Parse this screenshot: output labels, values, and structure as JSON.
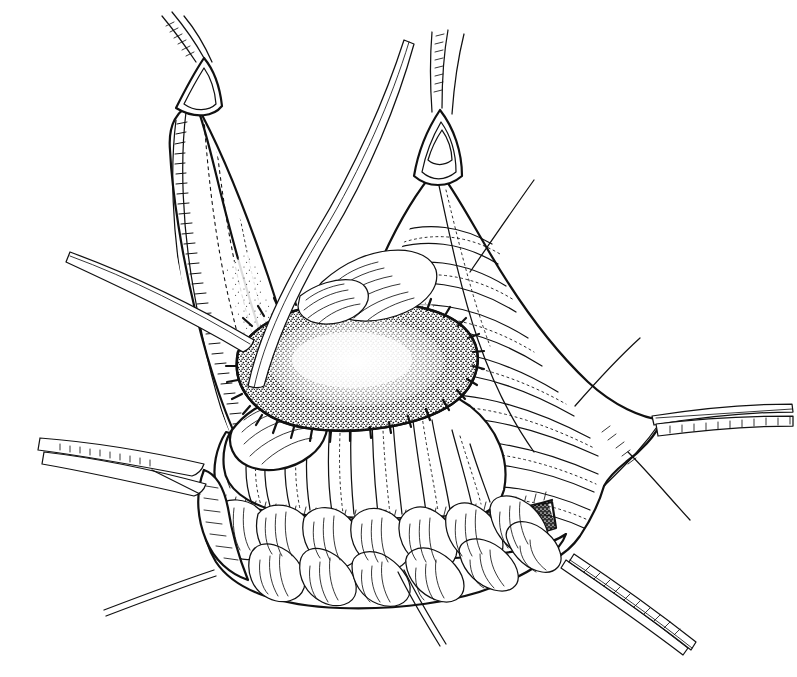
{
  "figure": {
    "domain": "medical-surgical-line-art",
    "title": "",
    "caption": "",
    "technique": "pen-and-ink stipple and hatch line drawing",
    "background_color": "#ffffff",
    "ink_color": "#111111",
    "width": 797,
    "height": 677,
    "has_text_labels": false,
    "label_count": 0
  },
  "scene": {
    "subject": "abdominal wall / hernia repair with sutured graft patch",
    "view": "intraoperative close-up, oblique",
    "regions": [
      {
        "name": "left-tissue-flap",
        "description": "tall conical flap of fascia retracted upward at left, hatched cut edge on its left margin",
        "apex": [
          200,
          95
        ],
        "clamped": true
      },
      {
        "name": "right-tissue-flap",
        "description": "large broad flap retracted upward and to the right, wrinkled transverse folds",
        "apex": [
          432,
          150
        ],
        "clamped": true
      },
      {
        "name": "graft-patch",
        "description": "oval stippled graft/mesh inlay sutured around its whole perimeter",
        "center": [
          358,
          365
        ],
        "approx_width": 230,
        "approx_height": 110
      },
      {
        "name": "bowel-loops",
        "description": "coils of small bowel visible in the depth beneath the lower tissue edge",
        "center": [
          330,
          540
        ]
      },
      {
        "name": "dark-shadow-band",
        "description": "solid dark stippled shadow band under the everted lower tissue edge",
        "center": [
          330,
          512
        ]
      }
    ]
  },
  "instruments": [
    {
      "id": "clamp-left-apex",
      "type": "triangular-jaw tissue clamp",
      "name": "left apex clamp",
      "grip_point": [
        196,
        100
      ],
      "shaft_angle_deg": 62,
      "has_ratchet_serrations": true
    },
    {
      "id": "clamp-right-apex",
      "type": "triangular-jaw tissue clamp",
      "name": "right apex clamp",
      "grip_point": [
        437,
        160
      ],
      "shaft_angle_deg": 78,
      "has_ratchet_serrations": true
    },
    {
      "id": "retractor-long-curved",
      "type": "long curved retractor / probe",
      "name": "curved retractor crossing midline",
      "tip": [
        250,
        390
      ],
      "handle": [
        410,
        40
      ]
    },
    {
      "id": "forceps-upper-left",
      "type": "straight forceps",
      "name": "upper left forceps",
      "tip": [
        250,
        345
      ],
      "handle": [
        70,
        252
      ]
    },
    {
      "id": "forceps-lower-left",
      "type": "hemostat forceps",
      "name": "lower left hemostat",
      "tip": [
        200,
        462
      ],
      "handle": [
        40,
        440
      ],
      "has_ratchet_serrations": true
    },
    {
      "id": "hemostat-right",
      "type": "hemostat",
      "name": "right edge hemostat",
      "tip": [
        655,
        418
      ],
      "handle": [
        790,
        430
      ],
      "has_ratchet_serrations": true
    },
    {
      "id": "hemostat-lower-right",
      "type": "hemostat",
      "name": "lower right hemostat",
      "tip": [
        568,
        566
      ],
      "handle": [
        690,
        640
      ],
      "has_ratchet_serrations": true
    }
  ],
  "sutures": [
    {
      "id": "graft-perimeter-suture",
      "name": "interrupted perimeter sutures around graft",
      "style": "interrupted",
      "stitch_count": 34,
      "closed_loop": true
    },
    {
      "id": "free-thread-upper-right",
      "name": "free suture thread upper right",
      "from": [
        470,
        270
      ],
      "to": [
        535,
        178
      ]
    },
    {
      "id": "free-thread-right",
      "name": "free suture thread right margin",
      "from": [
        575,
        405
      ],
      "to": [
        640,
        338
      ]
    },
    {
      "id": "free-thread-lower-right",
      "name": "free suture thread lower right",
      "from": [
        630,
        452
      ],
      "to": [
        690,
        520
      ]
    },
    {
      "id": "free-thread-lower-left",
      "name": "free suture thread lower left",
      "from": [
        213,
        570
      ],
      "to": [
        104,
        610
      ]
    },
    {
      "id": "free-thread-lower-center",
      "name": "free suture thread lower center",
      "from": [
        400,
        572
      ],
      "to": [
        440,
        645
      ]
    }
  ]
}
